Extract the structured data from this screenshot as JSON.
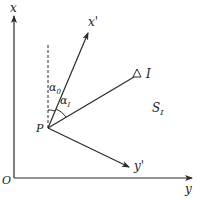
{
  "diagram": {
    "colors": {
      "line": "#2a2a2a",
      "background": "#ffffff"
    },
    "axes": {
      "x_label": "x",
      "y_label": "y",
      "origin_label": "O"
    },
    "local_axes": {
      "x_prime_label": "x'",
      "y_prime_label": "y'"
    },
    "point_P": {
      "label": "P"
    },
    "target_I": {
      "label": "I",
      "marker": "triangle"
    },
    "distance_label": {
      "base": "S",
      "subscript": "I"
    },
    "angles": [
      {
        "base": "α",
        "subscript": "0"
      },
      {
        "base": "α",
        "subscript": "I"
      }
    ]
  }
}
